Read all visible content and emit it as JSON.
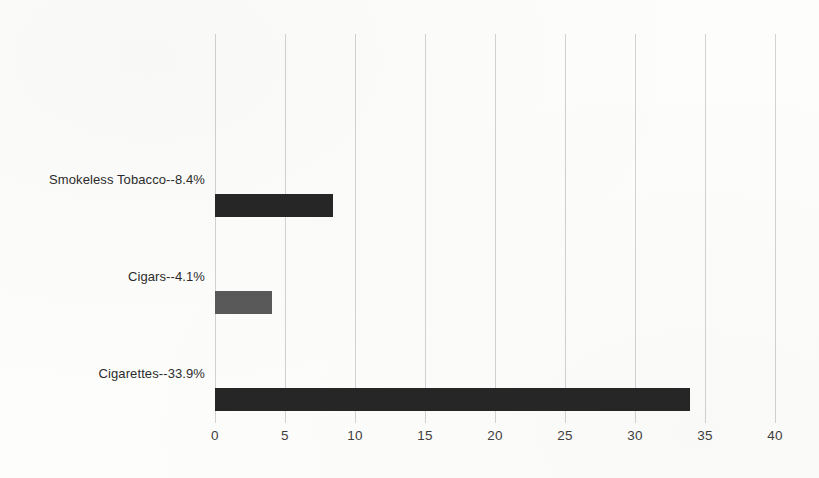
{
  "chart_data": {
    "type": "bar",
    "orientation": "horizontal",
    "title": "",
    "subtitle": "",
    "xlabel": "",
    "ylabel": "",
    "categories": [
      "Cigarettes",
      "Cigars",
      "Smokeless Tobacco"
    ],
    "values": [
      33.9,
      4.1,
      8.4
    ],
    "series": [
      {
        "name": "Percent",
        "values": [
          33.9,
          4.1,
          8.4
        ]
      }
    ],
    "bar_labels": [
      "Cigarettes--33.9%",
      "Cigars--4.1%",
      "Smokeless Tobacco--8.4%"
    ],
    "bar_colors": [
      "#262626",
      "#595959",
      "#262626"
    ],
    "xlim": [
      0,
      40
    ],
    "xticks": [
      0,
      5,
      10,
      15,
      20,
      25,
      30,
      35,
      40
    ],
    "xtick_labels": [
      "0",
      "5",
      "10",
      "15",
      "20",
      "25",
      "30",
      "35",
      "40"
    ],
    "grid": "vertical",
    "legend": "none",
    "gridline_color": "#d2d2d2",
    "background_color": "#fdfdfc",
    "text_color": "#2b2b2b"
  }
}
